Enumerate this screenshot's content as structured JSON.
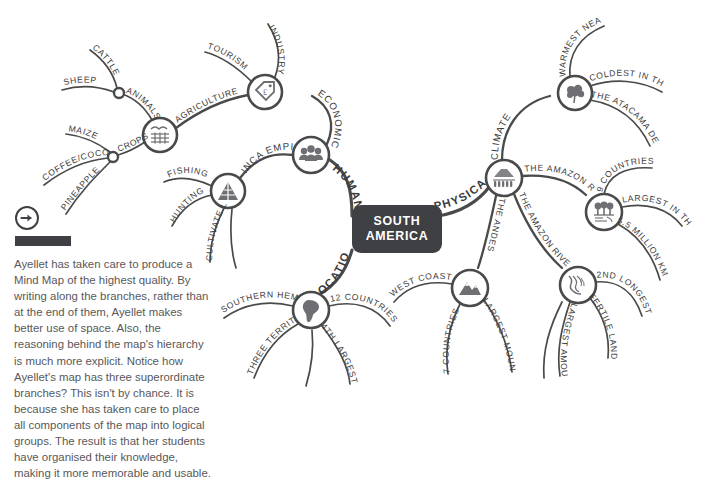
{
  "page": {
    "center_node": {
      "line1": "SOUTH",
      "line2": "AMERICA"
    }
  },
  "side_panel": {
    "icon": "arrow-right-circle-icon",
    "body": "Ayellet has taken care to produce a Mind Map of the highest quality. By writing along the branches, rather than at the end of them, Ayellet makes better use of space. Also, the reasoning behind the map's hierarchy is much more explicit. Notice how Ayellet's map has three superordinate branches? This isn't by chance. It is because she has taken care to place all components of the map into logical groups. The result is that her students have organised their knowledge, making it more memorable and usable."
  },
  "branches": {
    "human": {
      "label": "HUMAN",
      "icon": "people-group-icon",
      "children": {
        "economic": {
          "label": "ECONOMIC",
          "icon": "price-tag-pound-icon",
          "children": [
            {
              "label": "INDUSTRY"
            },
            {
              "label": "TOURISM"
            },
            {
              "label": "AGRICULTURE"
            }
          ]
        },
        "agriculture_node": {
          "icon": "farm-field-icon",
          "children": [
            {
              "label": "ANIMALS",
              "leaves": [
                "CATTLE",
                "SHEEP"
              ]
            },
            {
              "label": "CROPS",
              "leaves": [
                "MAIZE",
                "COFFEE/COCOA",
                "PINEAPPLE"
              ]
            }
          ]
        },
        "inca": {
          "label": "INCA EMPIRE",
          "icon": "pyramid-icon",
          "leaves": [
            "FISHING",
            "HUNTING",
            "CULTIVATE LAND"
          ]
        }
      }
    },
    "physical": {
      "label": "PHYSICAL",
      "icon": "mountain-forest-icon",
      "children": {
        "climate": {
          "label": "CLIMATE",
          "icon": "tree-icon",
          "leaves": [
            "WARMEST NEAR EQUATOR",
            "COLDEST IN THE FAR SOUTH",
            "THE ATACAMA DESERT"
          ]
        },
        "amazon_rainforest": {
          "label": "THE AMAZON RAINFOREST",
          "icon": "rainforest-icon",
          "leaves": [
            "9 COUNTRIES",
            "LARGEST IN THE WORLD",
            "5.5 MILLION KM"
          ]
        },
        "amazon_river": {
          "label": "THE AMAZON RIVER",
          "icon": "river-icon",
          "leaves": [
            "2ND LONGEST",
            "FERTILE LAND",
            "LARGEST AMOUNT OF WATER"
          ]
        },
        "andes": {
          "label": "THE ANDES",
          "icon": "mountain-icon",
          "leaves": [
            "WEST COAST",
            "7 COUNTRIES",
            "LARGEST MOUNTAIN RANGE"
          ]
        }
      }
    },
    "location": {
      "label": "LOCATION",
      "icon": "south-america-map-icon",
      "leaves": [
        "SOUTHERN HEMISPHERE",
        "THREE TERRITORIES",
        "12 COUNTRIES",
        "4TH LARGEST CONTINENT"
      ]
    }
  },
  "colors": {
    "ink": "#4a4a4a",
    "center_fill": "#3f4044",
    "center_text": "#ffffff",
    "body_text": "#58585a"
  }
}
